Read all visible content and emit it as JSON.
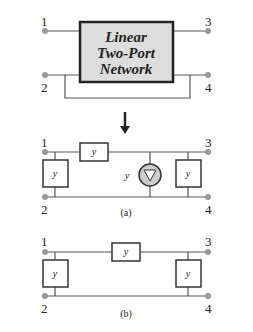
{
  "top": {
    "box": [
      "Linear",
      "Two-Port",
      "Network"
    ],
    "n1": "1",
    "n2": "2",
    "n3": "3",
    "n4": "4",
    "i1": "I",
    "i2": "I",
    "s1": "1",
    "s2": "2",
    "v1": "V",
    "v2": "V"
  },
  "a": {
    "yi": "y",
    "yr": "y",
    "yo": "y",
    "src": "y",
    "yis": "i",
    "yrs": "r",
    "yos": "o",
    "srcs": "f",
    "srcv": "V",
    "srcvs": "i",
    "cap": "(a)"
  },
  "b": {
    "cap": "(b)"
  },
  "plus": "+",
  "minus": "–"
}
